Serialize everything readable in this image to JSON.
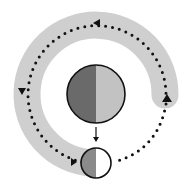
{
  "diagram": {
    "type": "cycle",
    "colors": {
      "band": "#cfcfcf",
      "dark_half": "#6a6a6a",
      "light_half": "#c2c2c2",
      "small_dark_half": "#8a8a8a",
      "small_light_half": "#ffffff",
      "outline": "#111111",
      "dots": "#111111"
    },
    "large_circle": {
      "cx": 96,
      "cy": 94,
      "r": 29
    },
    "small_circle": {
      "cx": 96,
      "cy": 163,
      "r": 15
    },
    "arrows": [
      {
        "position": "top",
        "direction": "left"
      },
      {
        "position": "left",
        "direction": "down"
      },
      {
        "position": "bottom-left",
        "direction": "right"
      },
      {
        "position": "right",
        "direction": "up"
      },
      {
        "position": "center",
        "direction": "down"
      }
    ]
  }
}
